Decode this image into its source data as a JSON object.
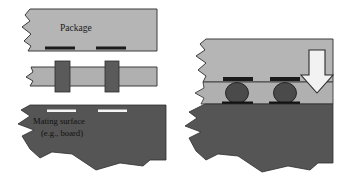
{
  "figure": {
    "type": "cross-section-diagram",
    "title_text": "",
    "background_color": "#ffffff",
    "views": [
      {
        "name": "exploded-view",
        "position": "left",
        "description": "Exploded cross-section: package above, interposer/socket in middle, mating board below"
      },
      {
        "name": "assembled-view",
        "position": "right",
        "description": "Assembled cross-section: package compressed onto board with solder balls, downward force arrow"
      }
    ]
  },
  "labels": {
    "package": "Package",
    "mating_surface_line1": "Mating surface",
    "mating_surface_line2": "(e.g., board)"
  },
  "colors": {
    "package_fill": "#b5b5b5",
    "package_stroke": "#3a3a3a",
    "interposer_fill": "#b0b0b0",
    "interposer_stroke": "#3a3a3a",
    "connector_fill": "#5a5a5a",
    "board_fill": "#555555",
    "board_stroke": "#2f2f2f",
    "pad_fill": "#1b1b1b",
    "solder_ball_fill": "#4a4a4a",
    "solder_ball_stroke": "#1f1f1f",
    "arrow_fill": "#f2f2f2",
    "arrow_stroke": "#2b2b2b",
    "text_color": "#1a1a1a"
  },
  "components": {
    "exploded": {
      "package_block": {
        "name": "package-body",
        "x": 22,
        "y": 9,
        "width": 134,
        "height": 42
      },
      "package_pads": [
        {
          "name": "package-pad-left",
          "x": 45,
          "y": 46,
          "width": 29,
          "height": 3
        },
        {
          "name": "package-pad-right",
          "x": 96,
          "y": 46,
          "width": 29,
          "height": 3
        }
      ],
      "interposer": {
        "name": "interposer-body",
        "x": 24,
        "y": 67,
        "width": 132,
        "height": 19
      },
      "connectors": [
        {
          "name": "connector-post-left",
          "x": 55,
          "y": 61,
          "width": 14,
          "height": 31
        },
        {
          "name": "connector-post-right",
          "x": 105,
          "y": 61,
          "width": 13,
          "height": 31
        }
      ],
      "board": {
        "name": "mating-board",
        "x": 14,
        "y": 105,
        "width": 152,
        "height": 68
      },
      "board_pads": [
        {
          "name": "board-pad-left",
          "x": 47,
          "y": 110,
          "width": 28,
          "height": 2
        },
        {
          "name": "board-pad-right",
          "x": 98,
          "y": 110,
          "width": 28,
          "height": 2
        }
      ]
    },
    "assembled": {
      "package_block": {
        "name": "package-body-assembled",
        "x": 198,
        "y": 39,
        "width": 135,
        "height": 47
      },
      "package_pads": [
        {
          "name": "package-pad-left-assembled",
          "x": 223,
          "y": 78,
          "width": 29,
          "height": 4
        },
        {
          "name": "package-pad-right-assembled",
          "x": 270,
          "y": 78,
          "width": 29,
          "height": 4
        }
      ],
      "interposer": {
        "name": "interposer-assembled",
        "x": 196,
        "y": 82,
        "width": 137,
        "height": 22
      },
      "solder_balls": [
        {
          "name": "solder-ball-left",
          "cx": 237,
          "cy": 93,
          "rx": 11,
          "ry": 10
        },
        {
          "name": "solder-ball-right",
          "cx": 285,
          "cy": 93,
          "rx": 11,
          "ry": 10
        }
      ],
      "board_pads": [
        {
          "name": "board-pad-left-assembled",
          "x": 222,
          "y": 102,
          "width": 30,
          "height": 3
        },
        {
          "name": "board-pad-right-assembled",
          "x": 269,
          "y": 102,
          "width": 30,
          "height": 3
        }
      ],
      "board": {
        "name": "mating-board-assembled",
        "x": 190,
        "y": 104,
        "width": 143,
        "height": 68
      },
      "force_arrow": {
        "name": "downward-force-arrow",
        "direction": "down",
        "x": 304,
        "y": 50,
        "width": 26,
        "height": 42
      }
    }
  }
}
